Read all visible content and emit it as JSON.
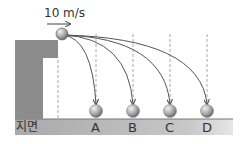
{
  "diagram": {
    "velocity_label": "10 m/s",
    "ground_label": "지면",
    "landing_points": [
      {
        "label": "A",
        "x": 96
      },
      {
        "label": "B",
        "x": 133
      },
      {
        "label": "C",
        "x": 170
      },
      {
        "label": "D",
        "x": 207
      }
    ],
    "colors": {
      "cliff": "#8c8c8c",
      "ground": "#b5b5b5",
      "ball": "#9a9a9a",
      "trajectory": "#555555",
      "dashed": "#aaaaaa"
    }
  }
}
